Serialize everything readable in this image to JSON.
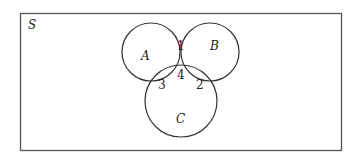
{
  "diagram": {
    "type": "venn",
    "universe": {
      "label": "S"
    },
    "sets": [
      {
        "id": "A",
        "label": "A"
      },
      {
        "id": "B",
        "label": "B"
      },
      {
        "id": "C",
        "label": "C"
      }
    ],
    "regions": [
      {
        "label": "1",
        "meaning": "A ∩ B only"
      },
      {
        "label": "2",
        "meaning": "B ∩ C only"
      },
      {
        "label": "3",
        "meaning": "A ∩ C only"
      },
      {
        "label": "4",
        "meaning": "A ∩ B ∩ C"
      }
    ],
    "colors": {
      "stroke": "#333333",
      "background": "#ffffff",
      "text": "#222222"
    }
  }
}
